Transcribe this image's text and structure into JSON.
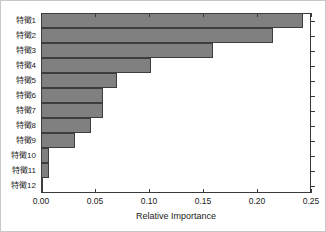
{
  "chart_data": {
    "type": "bar",
    "orientation": "horizontal",
    "title": "",
    "subtitle": "",
    "xlabel": "Relative Importance",
    "ylabel": "",
    "categories": [
      "特徵1",
      "特徵2",
      "特徵3",
      "特徵4",
      "特徵5",
      "特徵6",
      "特徵7",
      "特徵8",
      "特徵9",
      "特徵10",
      "特徵11",
      "特徵12"
    ],
    "values": [
      0.2426,
      0.215,
      0.1593,
      0.1019,
      0.0704,
      0.0574,
      0.0574,
      0.0463,
      0.0315,
      0.0074,
      0.0074,
      0.0019
    ],
    "xlim": [
      0.0,
      0.25
    ],
    "xticks": [
      0.0,
      0.05,
      0.1,
      0.15,
      0.2,
      0.25
    ],
    "xticklabels": [
      "0.00",
      "0.05",
      "0.10",
      "0.15",
      "0.20",
      "0.25"
    ],
    "grid": false,
    "legend": null,
    "bar_color": "#808080",
    "bar_edge_color": "#3d3d3d",
    "axis_color": "#3a3a3a",
    "background_color": "#ffffff"
  }
}
